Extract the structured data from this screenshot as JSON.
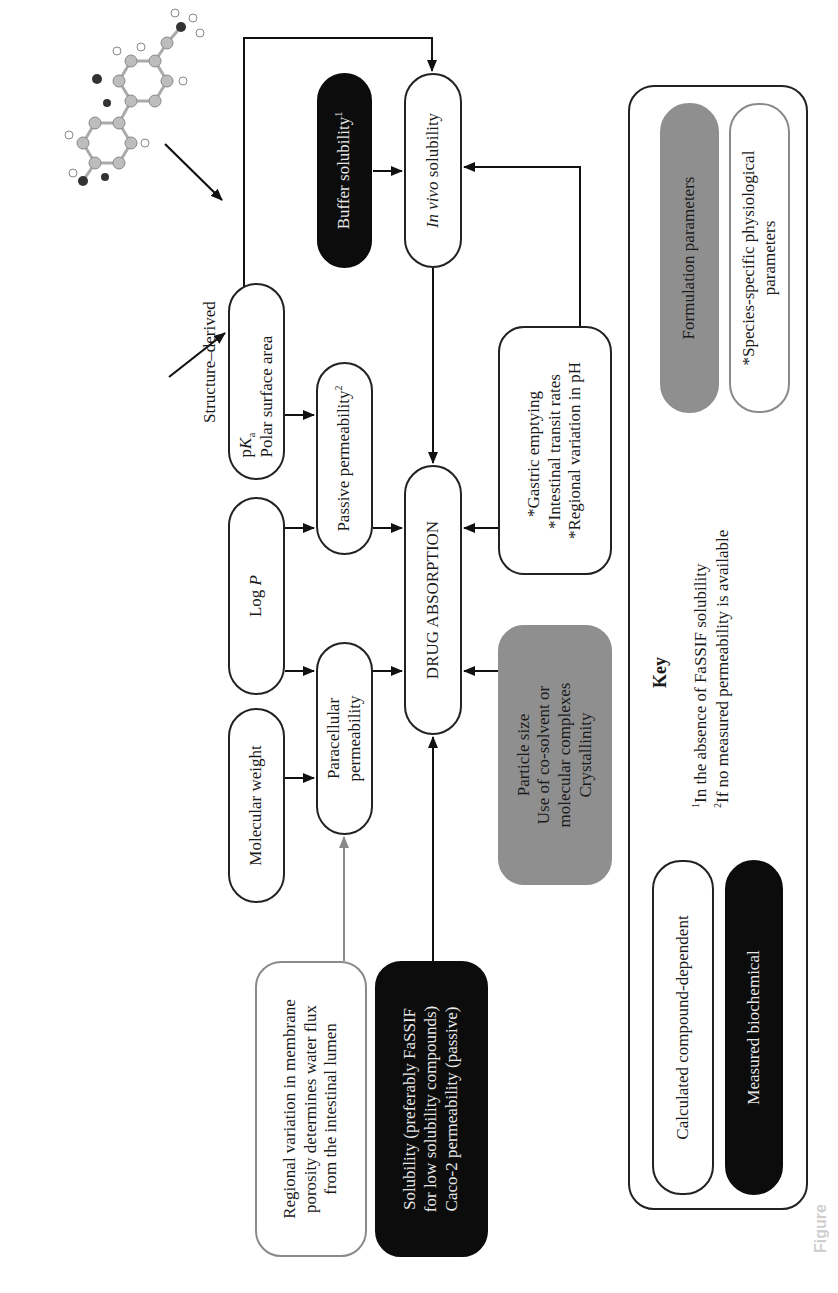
{
  "figure": {
    "orientation": "rotated-90-ccw",
    "structure_label": "Structure–derived",
    "molecule_icon": "ball-and-stick-molecule",
    "central_node": "DRUG ABSORPTION",
    "nodes": {
      "molecular_weight": "Molecular weight",
      "log_p_prefix": "Log ",
      "log_p_var": "P",
      "pka_prefix": "p",
      "pka_var": "K",
      "pka_sub": "a",
      "polar_surface_area": "Polar surface area",
      "paracellular_line1": "Paracellular",
      "paracellular_line2": "permeability",
      "passive_permeability": "Passive permeability",
      "passive_permeability_note": "2",
      "buffer_solubility": "Buffer solubility",
      "buffer_solubility_note": "1",
      "in_vivo_italic": "In vivo",
      "in_vivo_rest": " solubility",
      "regional_line1": "Regional variation in membrane",
      "regional_line2": "porosity determines water flux",
      "regional_line3": "from the intestinal lumen",
      "solubility_line1": "Solubility (preferably FaSSIF",
      "solubility_line2": "for low solubility compounds)",
      "solubility_line3": "Caco-2 permeability (passive)",
      "formulation_line1": "Particle size",
      "formulation_line2": "Use of co-solvent or",
      "formulation_line3": "molecular complexes",
      "formulation_line4": "Crystallinity",
      "physio_line1": "*Gastric emptying",
      "physio_line2": "*Intestinal transit rates",
      "physio_line3": "*Regional variation in pH"
    },
    "key": {
      "title": "Key",
      "footnote1_mark": "1",
      "footnote1": "In the absence of FaSSIF solubility",
      "footnote2_mark": "2",
      "footnote2": "If no measured permeability is available",
      "calculated": "Calculated compound-dependent",
      "measured": "Measured biochemical",
      "formulation": "Formulation parameters",
      "species_line1": "*Species-specific physiological",
      "species_line2": "parameters"
    },
    "caption_fragment": "Figure",
    "colors": {
      "black_fill": "#0c0c0c",
      "gray_fill": "#8f8f8f",
      "gray_outline": "#8a8a8a",
      "stroke": "#222222"
    }
  }
}
